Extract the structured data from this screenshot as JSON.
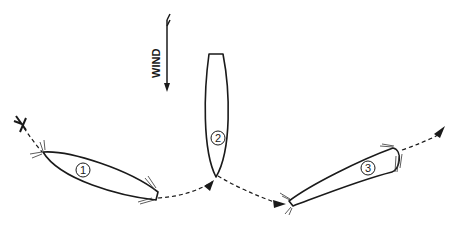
{
  "diagram": {
    "type": "sailing-maneuver",
    "wind_label": "WIND",
    "boats": [
      {
        "id": 1,
        "label": "1"
      },
      {
        "id": 2,
        "label": "2"
      },
      {
        "id": 3,
        "label": "3"
      }
    ],
    "start_marker": "X",
    "colors": {
      "stroke": "#1a1a1a",
      "background": "#ffffff"
    }
  }
}
